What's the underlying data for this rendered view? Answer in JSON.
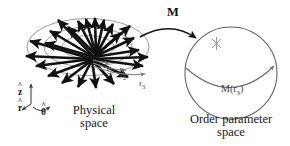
{
  "figure": {
    "type": "physics-diagram",
    "background_color": "#ffffff",
    "ink_color": "#111111",
    "grey_color": "#6f6f6f"
  },
  "physical_space": {
    "caption_line1": "Physical",
    "caption_line2": "space",
    "radii_labels": [
      {
        "text": "r",
        "sub": "1"
      },
      {
        "text": "r",
        "sub": "2"
      },
      {
        "text": "r",
        "sub": "3"
      }
    ],
    "axes": [
      {
        "name": "z-axis",
        "symbol": "z",
        "accent": "^"
      },
      {
        "name": "r-axis",
        "symbol": "r",
        "accent": "^"
      },
      {
        "name": "theta-axis",
        "symbol": "θ",
        "accent": "^"
      }
    ],
    "vector_count": 24,
    "ellipse_count": 3
  },
  "mapping": {
    "label": "M",
    "arrow": "curved-arrow-right"
  },
  "order_parameter_space": {
    "caption_line1": "Order parameter",
    "caption_line2": "space",
    "image_label": {
      "text": "M(r",
      "sub": "3",
      "tail": ")"
    },
    "marker": "asterisk-marker",
    "equator": "equator-arc-with-arrow"
  }
}
